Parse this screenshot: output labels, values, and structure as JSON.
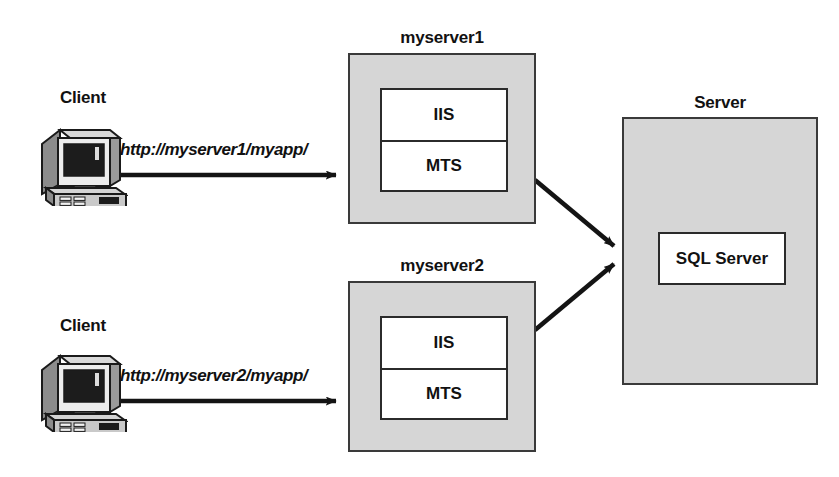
{
  "diagram": {
    "background_color": "#ffffff",
    "box_fill_color": "#d6d6d6",
    "inner_fill_color": "#ffffff",
    "line_color": "#1a1a1a"
  },
  "clients": [
    {
      "id": "client-top",
      "label": "Client",
      "icon": "desktop-computer-icon",
      "request_url": "http://myserver1/myapp/",
      "target": "myserver1"
    },
    {
      "id": "client-bottom",
      "label": "Client",
      "icon": "desktop-computer-icon",
      "request_url": "http://myserver2/myapp/",
      "target": "myserver2"
    }
  ],
  "web_servers": [
    {
      "id": "myserver1",
      "label": "myserver1",
      "components": [
        {
          "label": "IIS"
        },
        {
          "label": "MTS"
        }
      ]
    },
    {
      "id": "myserver2",
      "label": "myserver2",
      "components": [
        {
          "label": "IIS"
        },
        {
          "label": "MTS"
        }
      ]
    }
  ],
  "database_server": {
    "id": "server",
    "label": "Server",
    "component": {
      "label": "SQL Server"
    }
  },
  "connections": [
    {
      "from": "client-top",
      "to": "myserver1",
      "label": "http://myserver1/myapp/",
      "style": "solid-arrow"
    },
    {
      "from": "client-bottom",
      "to": "myserver2",
      "label": "http://myserver2/myapp/",
      "style": "solid-arrow"
    },
    {
      "from": "myserver1",
      "to": "server",
      "label": "",
      "style": "solid-arrow"
    },
    {
      "from": "myserver2",
      "to": "server",
      "label": "",
      "style": "solid-arrow"
    }
  ]
}
